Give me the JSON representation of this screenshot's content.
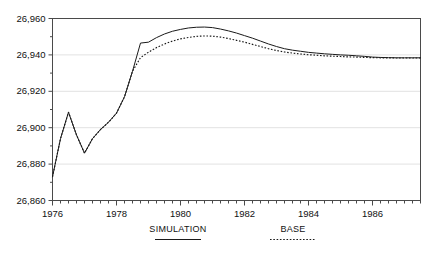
{
  "chart_data": {
    "type": "line",
    "title": "",
    "subtitle": "",
    "xlabel": "",
    "ylabel": "",
    "xlim": [
      1976.0,
      1987.5
    ],
    "ylim": [
      26860,
      26960
    ],
    "grid": true,
    "grid_axis": "y",
    "legend_position": "bottom",
    "y_ticks": [
      26860,
      26880,
      26900,
      26920,
      26940,
      26960
    ],
    "y_tick_labels": [
      "26,860",
      "26,880",
      "26,900",
      "26,920",
      "26,940",
      "26,960"
    ],
    "x_ticks": [
      1976,
      1978,
      1980,
      1982,
      1984,
      1986
    ],
    "x_tick_labels": [
      "1976",
      "1978",
      "1980",
      "1982",
      "1984",
      "1986"
    ],
    "x_minor_tick_step": 0.25,
    "x": [
      1976.0,
      1976.25,
      1976.5,
      1976.75,
      1977.0,
      1977.25,
      1977.5,
      1977.75,
      1978.0,
      1978.25,
      1978.5,
      1978.75,
      1979.0,
      1979.25,
      1979.5,
      1979.75,
      1980.0,
      1980.25,
      1980.5,
      1980.75,
      1981.0,
      1981.25,
      1981.5,
      1981.75,
      1982.0,
      1982.25,
      1982.5,
      1982.75,
      1983.0,
      1983.25,
      1983.5,
      1983.75,
      1984.0,
      1984.25,
      1984.5,
      1984.75,
      1985.0,
      1985.25,
      1985.5,
      1985.75,
      1986.0,
      1986.25,
      1986.5,
      1986.75,
      1987.0,
      1987.25,
      1987.5
    ],
    "series": [
      {
        "name": "SIMULATION",
        "style": "solid",
        "color": "#1a1a1a",
        "values": [
          26873.0,
          26894.0,
          26908.5,
          26896.0,
          26886.0,
          26894.0,
          26899.0,
          26903.0,
          26908.0,
          26917.0,
          26931.0,
          26946.5,
          26947.0,
          26949.5,
          26951.5,
          26953.0,
          26954.0,
          26954.8,
          26955.2,
          26955.3,
          26955.0,
          26954.2,
          26953.2,
          26952.0,
          26950.6,
          26949.2,
          26947.6,
          26946.0,
          26944.6,
          26943.4,
          26942.6,
          26942.0,
          26941.4,
          26941.0,
          26940.6,
          26940.3,
          26940.0,
          26939.8,
          26939.5,
          26939.2,
          26938.8,
          26938.6,
          26938.5,
          26938.4,
          26938.4,
          26938.4,
          26938.4
        ]
      },
      {
        "name": "BASE",
        "style": "dotted",
        "color": "#1a1a1a",
        "values": [
          26873.0,
          26894.0,
          26908.5,
          26896.0,
          26886.0,
          26894.0,
          26899.0,
          26903.0,
          26908.0,
          26917.0,
          26931.0,
          26938.5,
          26941.5,
          26944.0,
          26946.0,
          26947.6,
          26948.8,
          26949.6,
          26950.2,
          26950.4,
          26950.3,
          26949.8,
          26949.0,
          26948.0,
          26947.0,
          26945.8,
          26944.6,
          26943.4,
          26942.4,
          26941.6,
          26941.0,
          26940.5,
          26940.1,
          26939.8,
          26939.5,
          26939.3,
          26939.1,
          26938.9,
          26938.8,
          26938.6,
          26938.5,
          26938.4,
          26938.4,
          26938.3,
          26938.3,
          26938.3,
          26938.3
        ]
      }
    ],
    "legend": [
      {
        "label": "SIMULATION",
        "style": "solid"
      },
      {
        "label": "BASE",
        "style": "dotted"
      }
    ]
  }
}
